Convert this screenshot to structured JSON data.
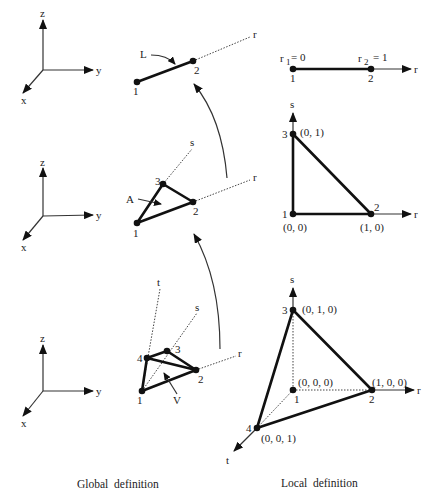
{
  "global_axes": {
    "x": "x",
    "y": "y",
    "z": "z"
  },
  "line_element": {
    "label": "L",
    "nodes": [
      "1",
      "2"
    ],
    "axis": "r"
  },
  "triangle_element": {
    "label": "A",
    "nodes": [
      "1",
      "2",
      "3"
    ],
    "axes": [
      "r",
      "s"
    ]
  },
  "tet_element": {
    "label": "V",
    "nodes": [
      "1",
      "2",
      "3",
      "4"
    ],
    "axes": [
      "r",
      "s",
      "t"
    ]
  },
  "local_line": {
    "r1": "r",
    "r1_sub": "1",
    "r1_val": "= 0",
    "r2": "r",
    "r2_sub": "2",
    "r2_val": "= 1",
    "nodes": [
      "1",
      "2"
    ],
    "axis": "r"
  },
  "local_triangle": {
    "nodes": [
      "1",
      "2",
      "3"
    ],
    "coords": [
      "(0, 0)",
      "(1, 0)",
      "(0, 1)"
    ],
    "axes": [
      "r",
      "s"
    ]
  },
  "local_tet": {
    "nodes": [
      "1",
      "2",
      "3",
      "4"
    ],
    "coords": [
      "(0, 0, 0)",
      "(1, 0, 0)",
      "(0, 1, 0)",
      "(0, 0, 1)"
    ],
    "axes": [
      "r",
      "s",
      "t"
    ]
  },
  "captions": {
    "global": "Global  definition",
    "local": "Local  definition"
  }
}
